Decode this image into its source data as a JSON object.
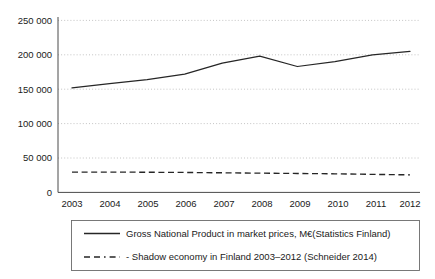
{
  "chart_data": {
    "type": "line",
    "title": "",
    "subtitle": "",
    "xlabel": "",
    "ylabel": "",
    "categories": [
      "2003",
      "2004",
      "2005",
      "2006",
      "2007",
      "2008",
      "2009",
      "2010",
      "2011",
      "2012"
    ],
    "x": [
      2003,
      2004,
      2005,
      2006,
      2007,
      2008,
      2009,
      2010,
      2011,
      2012
    ],
    "xlim": [
      2003,
      2012
    ],
    "ylim": [
      0,
      250000
    ],
    "y_ticks": [
      0,
      50000,
      100000,
      150000,
      200000,
      250000
    ],
    "y_tick_labels": [
      "0",
      "50 000",
      "100 000",
      "150 000",
      "200 000",
      "250 000"
    ],
    "x_tick_labels": [
      "2003",
      "2004",
      "2005",
      "2006",
      "2007",
      "2008",
      "2009",
      "2010",
      "2011",
      "2012"
    ],
    "grid": "horizontal-dotted",
    "legend_position": "below-plot",
    "series": [
      {
        "name": "Gross National Product in market prices, M€(Statistics Finland)",
        "style": "solid",
        "color": "#262626",
        "values": [
          152000,
          158000,
          164000,
          172000,
          188000,
          198000,
          183000,
          190000,
          200000,
          205000
        ]
      },
      {
        "name": "- Shadow economy in Finland 2003–2012 (Schneider 2014)",
        "style": "dashed",
        "color": "#262626",
        "values": [
          29500,
          29500,
          29300,
          29000,
          28500,
          28000,
          27500,
          27000,
          26200,
          25500
        ]
      }
    ]
  },
  "legend": {
    "items": [
      {
        "label": "Gross National Product in market prices, M€(Statistics Finland)",
        "style": "solid"
      },
      {
        "label": "- Shadow economy in Finland 2003–2012 (Schneider 2014)",
        "style": "dashed"
      }
    ]
  },
  "colors": {
    "background": "#ffffff",
    "ink": "#1a1a1a",
    "line": "#262626",
    "grid": "#b5b5b5",
    "axis": "#4a4a4a",
    "legend_border": "#6b6b6b"
  }
}
